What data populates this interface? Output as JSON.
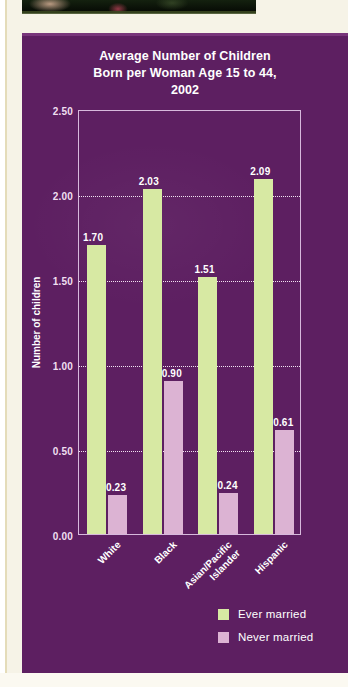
{
  "chart_data": {
    "type": "bar",
    "title": "Average Number of Children Born per Woman Age 15 to 44, 2002",
    "title_lines": [
      "Average Number of Children",
      "Born per Woman Age 15 to 44,",
      "2002"
    ],
    "xlabel": "",
    "ylabel": "Number of children",
    "ylim": [
      0,
      2.5
    ],
    "yticks": [
      "0.00",
      "0.50",
      "1.00",
      "1.50",
      "2.00",
      "2.50"
    ],
    "ytick_values": [
      0,
      0.5,
      1.0,
      1.5,
      2.0,
      2.5
    ],
    "grid": "horizontal-dotted",
    "legend_position": "bottom-right",
    "categories": [
      "White",
      "Black",
      "Asian/Pacific Islander",
      "Hispanic"
    ],
    "series": [
      {
        "name": "Ever married",
        "color": "#d7e9a3",
        "values": [
          1.7,
          2.03,
          1.51,
          2.09
        ],
        "labels": [
          "1.70",
          "2.03",
          "1.51",
          "2.09"
        ]
      },
      {
        "name": "Never married",
        "color": "#dcb3d3",
        "values": [
          0.23,
          0.9,
          0.24,
          0.61
        ],
        "labels": [
          "0.23",
          "0.90",
          "0.24",
          "0.61"
        ]
      }
    ]
  },
  "colors": {
    "panel_background": "#5d1f61",
    "ever_married": "#d7e9a3",
    "never_married": "#dcb3d3",
    "axis": "#d7b9dc",
    "gridline": "#f2e2f2",
    "text": "#ffffff",
    "paper": "#f6f3e7"
  },
  "decorations": {
    "photo_strip": "dark-photo-banner"
  }
}
